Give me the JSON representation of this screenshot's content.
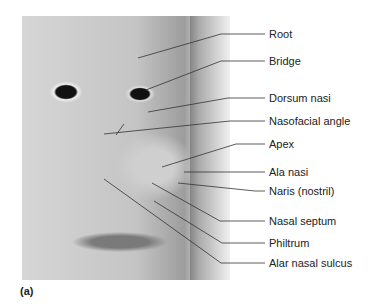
{
  "figure": {
    "caption": "(a)",
    "image_description": "Grayscale close-up photograph of a woman's face with leader lines pointing to parts of the nose",
    "labels": [
      {
        "text": "Root",
        "y": 34
      },
      {
        "text": "Bridge",
        "y": 61
      },
      {
        "text": "Dorsum nasi",
        "y": 98
      },
      {
        "text": "Nasofacial angle",
        "y": 121
      },
      {
        "text": "Apex",
        "y": 144
      },
      {
        "text": "Ala nasi",
        "y": 172
      },
      {
        "text": "Naris (nostril)",
        "y": 191
      },
      {
        "text": "Nasal septum",
        "y": 221
      },
      {
        "text": "Philtrum",
        "y": 243
      },
      {
        "text": "Alar nasal sulcus",
        "y": 263
      }
    ]
  }
}
